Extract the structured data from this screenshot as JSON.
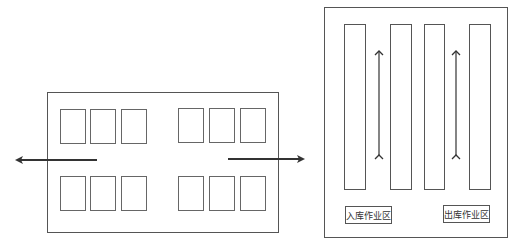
{
  "diagram": {
    "left_layout": {
      "frame": {
        "x": 47,
        "y": 92,
        "w": 232,
        "h": 141
      },
      "slots": [
        {
          "x": 60,
          "y": 109,
          "w": 26,
          "h": 35
        },
        {
          "x": 90,
          "y": 109,
          "w": 26,
          "h": 35
        },
        {
          "x": 121,
          "y": 109,
          "w": 26,
          "h": 35
        },
        {
          "x": 178,
          "y": 108,
          "w": 26,
          "h": 35
        },
        {
          "x": 209,
          "y": 108,
          "w": 26,
          "h": 35
        },
        {
          "x": 240,
          "y": 108,
          "w": 26,
          "h": 35
        },
        {
          "x": 60,
          "y": 176,
          "w": 26,
          "h": 35
        },
        {
          "x": 90,
          "y": 176,
          "w": 26,
          "h": 35
        },
        {
          "x": 121,
          "y": 176,
          "w": 26,
          "h": 35
        },
        {
          "x": 178,
          "y": 176,
          "w": 26,
          "h": 35
        },
        {
          "x": 209,
          "y": 176,
          "w": 26,
          "h": 35
        },
        {
          "x": 240,
          "y": 176,
          "w": 26,
          "h": 35
        }
      ],
      "arrows": [
        {
          "name": "exit-arrow-left",
          "x1": 97,
          "y1": 160,
          "x2": 17,
          "y2": 160
        },
        {
          "name": "exit-arrow-right",
          "x1": 228,
          "y1": 159,
          "x2": 303,
          "y2": 159
        }
      ]
    },
    "right_layout": {
      "frame": {
        "x": 324,
        "y": 7,
        "w": 184,
        "h": 231
      },
      "columns": [
        {
          "x": 344,
          "y": 24,
          "w": 22,
          "h": 166
        },
        {
          "x": 390,
          "y": 24,
          "w": 22,
          "h": 166
        },
        {
          "x": 424,
          "y": 24,
          "w": 21,
          "h": 166
        },
        {
          "x": 469,
          "y": 24,
          "w": 22,
          "h": 166
        }
      ],
      "double_arrows": [
        {
          "x": 379,
          "y1": 51,
          "y2": 155
        },
        {
          "x": 456,
          "y1": 51,
          "y2": 155
        }
      ],
      "labels": [
        {
          "text": "入库作业区",
          "x": 345,
          "y": 206,
          "w": 47,
          "h": 18
        },
        {
          "text": "出库作业区",
          "x": 443,
          "y": 205,
          "w": 47,
          "h": 18
        }
      ]
    },
    "colors": {
      "stroke": "#555555",
      "arrow": "#333333",
      "background": "#ffffff"
    }
  }
}
